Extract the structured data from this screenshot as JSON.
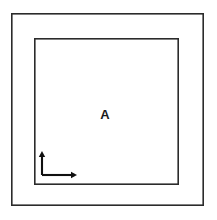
{
  "figure": {
    "background_color": "#ffffff",
    "stroke_color": "#2b2b2b",
    "axis_color": "#101010",
    "outer_boundary": {
      "name": "outer-rectangle",
      "x": 11,
      "y": 13,
      "width": 193,
      "height": 193,
      "stroke_width": 1.6
    },
    "inner_boundary": {
      "name": "inner-rectangle",
      "x": 34,
      "y": 38,
      "width": 145,
      "height": 147,
      "stroke_width": 1.6
    },
    "labels": [
      {
        "text": "A",
        "x": 105,
        "y": 114,
        "font_size": 13,
        "weight": "bold"
      }
    ],
    "axes_indicator": {
      "name": "coordinate-axes",
      "origin_x": 42,
      "origin_y": 175,
      "vertical_tip_y": 151,
      "horizontal_tip_x": 77,
      "stroke_width": 2.1,
      "arrowhead_length": 6,
      "arrowhead_half_width": 3.2
    }
  }
}
